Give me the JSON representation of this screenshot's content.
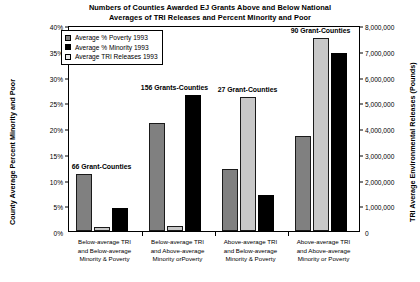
{
  "chart_data": {
    "type": "bar",
    "title": "Numbers of Counties Awarded EJ Grants Above and Below National Averages of TRI Releases and Percent Minority and Poor",
    "title_line1": "Numbers of Counties Awarded EJ Grants Above and Below National",
    "title_line2": "Averages of TRI Releases and Percent Minority and Poor",
    "xlabel": "",
    "ylabel": "County Average Percent Minority and Poor",
    "ylabel_right": "TRI Average Environmental Releases (Pounds)",
    "ylim": [
      0,
      40
    ],
    "ylim_right": [
      0,
      8000000
    ],
    "grid": false,
    "legend_position": "top-left",
    "categories": [
      "Below-average TRI and Below-average Minority & Poverty",
      "Below-average TRI and Above-average Minority orPoverty",
      "Above-average TRI and Below-average Minority & Poverty",
      "Above-average TRI and Above-average Minority or Poverty"
    ],
    "category_lines": [
      [
        "Below-average TRI",
        "and Below-average",
        "Minority & Poverty"
      ],
      [
        "Below-average TRI",
        "and Above-average",
        "Minority orPoverty"
      ],
      [
        "Above-average TRI",
        "and Below-average",
        "Minority & Poverty"
      ],
      [
        "Above-average TRI",
        "and Above-average",
        "Minority or Poverty"
      ]
    ],
    "series": [
      {
        "name": "Average % Poverty 1993",
        "axis": "left",
        "unit": "percent",
        "color": "#808080",
        "values": [
          11.0,
          21.0,
          12.0,
          18.5
        ]
      },
      {
        "name": "Average TRI Releases 1993",
        "axis": "right",
        "unit": "pounds",
        "color": "#c8c8c8",
        "values": [
          150000,
          200000,
          5200000,
          7500000
        ]
      },
      {
        "name": "Average % Minority 1993",
        "axis": "left",
        "unit": "percent",
        "color": "#000000",
        "values": [
          4.5,
          26.5,
          7.0,
          34.5
        ]
      }
    ],
    "annotations": [
      "66 Grant-Counties",
      "156 Grants-Counties",
      "27 Grant-Counties",
      "90 Grant-Counties"
    ],
    "yticks": [
      "0%",
      "5%",
      "10%",
      "15%",
      "20%",
      "25%",
      "30%",
      "35%",
      "40%"
    ],
    "yticks_right": [
      "0",
      "1,000,000",
      "2,000,000",
      "3,000,000",
      "4,000,000",
      "5,000,000",
      "6,000,000",
      "7,000,000",
      "8,000,000"
    ]
  },
  "legend": {
    "items": [
      {
        "label": "Average % Poverty 1993",
        "swatch": "poverty"
      },
      {
        "label": "Average % Minority 1993",
        "swatch": "minority"
      },
      {
        "label": "Average TRI Releases 1993",
        "swatch": "tri"
      }
    ]
  }
}
